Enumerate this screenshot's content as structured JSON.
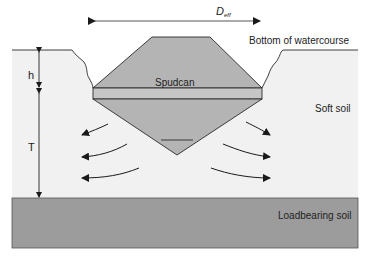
{
  "diagram": {
    "title_dimension": {
      "symbol": "D",
      "subscript": "eff"
    },
    "labels": {
      "bottom_of_watercourse": "Bottom of watercourse",
      "spudcan": "Spudcan",
      "soft_soil": "Soft soil",
      "loadbearing_soil": "Loadbearing soil",
      "h": "h",
      "t": "T"
    },
    "colors": {
      "background": "#ffffff",
      "soft_soil": "#f1f1f1",
      "loadbearing_soil": "#9c9c9c",
      "spudcan": "#b4b4b4",
      "lines": "#2a2a2a"
    },
    "flow_arrows": {
      "left_count": 3,
      "right_count": 3
    }
  }
}
